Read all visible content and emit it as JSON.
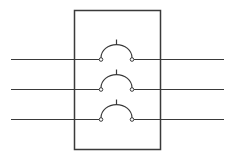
{
  "diagram": {
    "type": "three-pole-switch",
    "poles": [
      {
        "id": "pole-1"
      },
      {
        "id": "pole-2"
      },
      {
        "id": "pole-3"
      }
    ],
    "colors": {
      "line": "#3a3a3a",
      "background": "#ffffff"
    }
  }
}
